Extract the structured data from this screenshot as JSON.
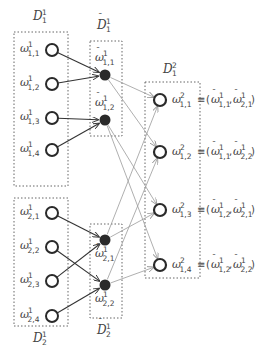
{
  "diagram": {
    "groups": [
      {
        "id": "D1_1",
        "label": "D",
        "sup": "1",
        "sub": "1",
        "tilde": false
      },
      {
        "id": "D2_1",
        "label": "D",
        "sup": "1",
        "sub": "2",
        "tilde": false
      },
      {
        "id": "Dt1_1",
        "label": "D",
        "sup": "1",
        "sub": "1",
        "tilde": true
      },
      {
        "id": "Dt2_1",
        "label": "D",
        "sup": "1",
        "sub": "2",
        "tilde": true
      },
      {
        "id": "D1_2",
        "label": "D",
        "sup": "2",
        "sub": "1",
        "tilde": false
      }
    ],
    "input_nodes": [
      {
        "id": "w11",
        "sub": "1,1",
        "sup": "1"
      },
      {
        "id": "w12",
        "sub": "1,2",
        "sup": "1"
      },
      {
        "id": "w13",
        "sub": "1,3",
        "sup": "1"
      },
      {
        "id": "w14",
        "sub": "1,4",
        "sup": "1"
      },
      {
        "id": "w21",
        "sub": "2,1",
        "sup": "1"
      },
      {
        "id": "w22",
        "sub": "2,2",
        "sup": "1"
      },
      {
        "id": "w23",
        "sub": "2,3",
        "sup": "1"
      },
      {
        "id": "w24",
        "sub": "2,4",
        "sup": "1"
      }
    ],
    "merged_nodes": [
      {
        "id": "wt11",
        "sub": "1,1",
        "sup": "1"
      },
      {
        "id": "wt12",
        "sub": "1,2",
        "sup": "1"
      },
      {
        "id": "wt21",
        "sub": "2,1",
        "sup": "1"
      },
      {
        "id": "wt22",
        "sub": "2,2",
        "sup": "1"
      }
    ],
    "output_nodes": [
      {
        "id": "o11",
        "sub": "1,1",
        "sup": "2",
        "a": "1,1",
        "b": "2,1"
      },
      {
        "id": "o12",
        "sub": "1,2",
        "sup": "2",
        "a": "1,1",
        "b": "2,2"
      },
      {
        "id": "o13",
        "sub": "1,3",
        "sup": "2",
        "a": "1,2",
        "b": "2,1"
      },
      {
        "id": "o14",
        "sub": "1,4",
        "sup": "2",
        "a": "1,2",
        "b": "2,2"
      }
    ],
    "edges_dark": [
      [
        "w11",
        "wt11"
      ],
      [
        "w12",
        "wt11"
      ],
      [
        "w13",
        "wt12"
      ],
      [
        "w14",
        "wt12"
      ],
      [
        "w21",
        "wt21"
      ],
      [
        "w23",
        "wt21"
      ],
      [
        "w22",
        "wt22"
      ],
      [
        "w24",
        "wt22"
      ]
    ],
    "edges_light": [
      [
        "wt11",
        "o11"
      ],
      [
        "wt11",
        "o12"
      ],
      [
        "wt12",
        "o13"
      ],
      [
        "wt12",
        "o14"
      ],
      [
        "wt21",
        "o11"
      ],
      [
        "wt21",
        "o13"
      ],
      [
        "wt22",
        "o12"
      ],
      [
        "wt22",
        "o14"
      ]
    ],
    "symbols": {
      "omega": "ω",
      "equiv": "≡",
      "open": "(",
      "close": ")",
      "comma": ","
    },
    "colors": {
      "dark_edge": "#333333",
      "light_edge": "#9a9a9a",
      "node": "#2a2a2a",
      "box": "#666666"
    }
  }
}
